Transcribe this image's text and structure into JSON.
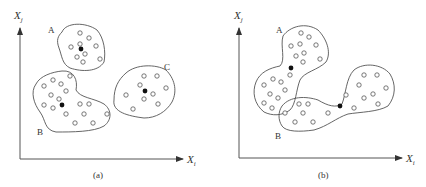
{
  "figure": {
    "panels": [
      {
        "id": "a",
        "caption": "(a)",
        "x_axis_label": "X",
        "x_axis_sub": "i",
        "y_axis_label": "X",
        "y_axis_sub": "j",
        "clusters": [
          {
            "label": "A",
            "points": [
              [
                80,
                33
              ],
              [
                89,
                38
              ],
              [
                71,
                47
              ],
              [
                80,
                45
              ],
              [
                96,
                46
              ],
              [
                85,
                54
              ],
              [
                77,
                57
              ],
              [
                100,
                59
              ],
              [
                83,
                62
              ]
            ],
            "center": [
              81,
              49
            ]
          },
          {
            "label": "B",
            "points": [
              [
                70,
                76
              ],
              [
                44,
                86
              ],
              [
                53,
                80
              ],
              [
                61,
                84
              ],
              [
                66,
                91
              ],
              [
                51,
                95
              ],
              [
                59,
                100
              ],
              [
                44,
                105
              ],
              [
                53,
                108
              ],
              [
                66,
                114
              ],
              [
                80,
                104
              ],
              [
                89,
                104
              ],
              [
                84,
                114
              ],
              [
                75,
                123
              ],
              [
                93,
                123
              ],
              [
                107,
                114
              ]
            ],
            "center": [
              62,
              105
            ]
          },
          {
            "label": "C",
            "points": [
              [
                144,
                76
              ],
              [
                157,
                76
              ],
              [
                140,
                85
              ],
              [
                166,
                88
              ],
              [
                126,
                95
              ],
              [
                153,
                94
              ],
              [
                144,
                99
              ],
              [
                158,
                104
              ],
              [
                133,
                109
              ]
            ],
            "center": [
              145,
              91
            ]
          }
        ]
      },
      {
        "id": "b",
        "caption": "(b)",
        "x_axis_label": "X",
        "x_axis_sub": "i",
        "y_axis_label": "X",
        "y_axis_sub": "j",
        "clusters": [
          {
            "label": "A",
            "points": [
              [
                301,
                33
              ],
              [
                309,
                37
              ],
              [
                291,
                46
              ],
              [
                300,
                44
              ],
              [
                316,
                45
              ],
              [
                296,
                56
              ],
              [
                304,
                53
              ],
              [
                320,
                59
              ],
              [
                303,
                62
              ],
              [
                290,
                75
              ],
              [
                264,
                85
              ],
              [
                273,
                79
              ],
              [
                281,
                82
              ],
              [
                285,
                90
              ],
              [
                270,
                94
              ],
              [
                278,
                98
              ],
              [
                264,
                103
              ],
              [
                272,
                108
              ]
            ],
            "center": [
              291,
              68
            ]
          },
          {
            "label": "B",
            "points": [
              [
                299,
                104
              ],
              [
                308,
                104
              ],
              [
                285,
                113
              ],
              [
                303,
                113
              ],
              [
                328,
                113
              ],
              [
                295,
                122
              ],
              [
                313,
                122
              ],
              [
                364,
                75
              ],
              [
                377,
                75
              ],
              [
                359,
                85
              ],
              [
                386,
                88
              ],
              [
                346,
                95
              ],
              [
                364,
                98
              ],
              [
                373,
                94
              ],
              [
                378,
                104
              ],
              [
                354,
                108
              ]
            ],
            "center": [
              340,
              106
            ]
          }
        ]
      }
    ]
  }
}
